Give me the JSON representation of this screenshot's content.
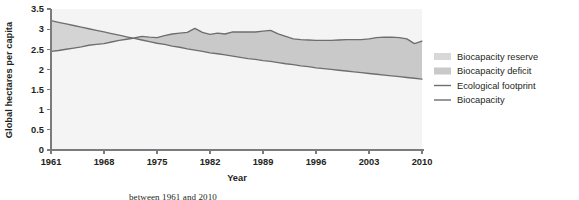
{
  "chart_data": {
    "type": "area",
    "title": "",
    "xlabel": "Year",
    "ylabel": "Global hectares per capita",
    "xlim": [
      1961,
      2010
    ],
    "ylim": [
      0,
      3.5
    ],
    "grid": false,
    "legend_position": "right",
    "xticks": [
      "1961",
      "1968",
      "1975",
      "1982",
      "1989",
      "1996",
      "2003",
      "2010"
    ],
    "xtick_values": [
      1961,
      1968,
      1975,
      1982,
      1989,
      1996,
      2003,
      2010
    ],
    "yticks": [
      "0",
      "0.5",
      "1",
      "1.5",
      "2",
      "2.5",
      "3",
      "3.5"
    ],
    "ytick_values": [
      0,
      0.5,
      1,
      1.5,
      2,
      2.5,
      3,
      3.5
    ],
    "x": [
      1961,
      1962,
      1963,
      1964,
      1965,
      1966,
      1967,
      1968,
      1969,
      1970,
      1971,
      1972,
      1973,
      1974,
      1975,
      1976,
      1977,
      1978,
      1979,
      1980,
      1981,
      1982,
      1983,
      1984,
      1985,
      1986,
      1987,
      1988,
      1989,
      1990,
      1991,
      1992,
      1993,
      1994,
      1995,
      1996,
      1997,
      1998,
      1999,
      2000,
      2001,
      2002,
      2003,
      2004,
      2005,
      2006,
      2007,
      2008,
      2009,
      2010
    ],
    "series": [
      {
        "name": "Ecological footprint",
        "color": "#6e6e6e",
        "values": [
          2.45,
          2.47,
          2.5,
          2.53,
          2.56,
          2.6,
          2.62,
          2.64,
          2.68,
          2.72,
          2.75,
          2.78,
          2.82,
          2.8,
          2.79,
          2.84,
          2.88,
          2.9,
          2.92,
          3.02,
          2.92,
          2.87,
          2.9,
          2.88,
          2.93,
          2.93,
          2.93,
          2.93,
          2.95,
          2.97,
          2.88,
          2.82,
          2.76,
          2.74,
          2.73,
          2.72,
          2.72,
          2.72,
          2.73,
          2.74,
          2.74,
          2.74,
          2.76,
          2.79,
          2.8,
          2.8,
          2.79,
          2.76,
          2.64,
          2.7
        ]
      },
      {
        "name": "Biocapacity",
        "color": "#6e6e6e",
        "values": [
          3.21,
          3.17,
          3.13,
          3.09,
          3.05,
          3.01,
          2.97,
          2.93,
          2.89,
          2.85,
          2.81,
          2.77,
          2.73,
          2.69,
          2.65,
          2.62,
          2.58,
          2.55,
          2.51,
          2.48,
          2.45,
          2.41,
          2.39,
          2.36,
          2.33,
          2.3,
          2.27,
          2.25,
          2.22,
          2.2,
          2.17,
          2.14,
          2.12,
          2.09,
          2.07,
          2.04,
          2.02,
          2.0,
          1.98,
          1.96,
          1.94,
          1.92,
          1.9,
          1.88,
          1.86,
          1.84,
          1.82,
          1.8,
          1.78,
          1.76
        ]
      }
    ],
    "fills": [
      {
        "name": "Biocapacity reserve",
        "color": "#d4d4d4",
        "description": "area where biocapacity exceeds ecological footprint"
      },
      {
        "name": "Biocapacity deficit",
        "color": "#c9c9c9",
        "description": "area where ecological footprint exceeds biocapacity"
      }
    ],
    "legend": [
      {
        "label": "Biocapacity reserve",
        "marker": "swatch",
        "color": "#d8d8d8"
      },
      {
        "label": "Biocapacity deficit",
        "marker": "swatch",
        "color": "#c9c9c9"
      },
      {
        "label": "Ecological footprint",
        "marker": "line",
        "color": "#6e6e6e"
      },
      {
        "label": "Biocapacity",
        "marker": "line",
        "color": "#6e6e6e"
      }
    ],
    "crossover_year": 1972
  },
  "caption": {
    "text": "between 1961 and 2010"
  }
}
